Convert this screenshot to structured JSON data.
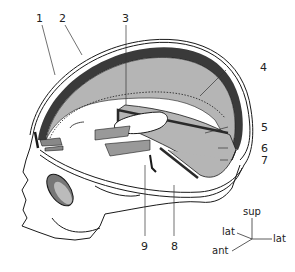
{
  "figure": {
    "labels": [
      {
        "id": "1",
        "text": "1"
      },
      {
        "id": "2",
        "text": "2"
      },
      {
        "id": "3",
        "text": "3"
      },
      {
        "id": "4",
        "text": "4"
      },
      {
        "id": "5",
        "text": "5"
      },
      {
        "id": "6",
        "text": "6"
      },
      {
        "id": "7",
        "text": "7"
      },
      {
        "id": "8",
        "text": "8"
      },
      {
        "id": "9",
        "text": "9"
      }
    ],
    "orientation": {
      "sup": "sup",
      "lat_left": "lat",
      "lat_right": "lat",
      "ant": "ant"
    },
    "colors": {
      "outline": "#1a1a1a",
      "falx_fill": "#b5b5b5",
      "dark_band": "#3a3a3a",
      "background": "#ffffff"
    }
  }
}
